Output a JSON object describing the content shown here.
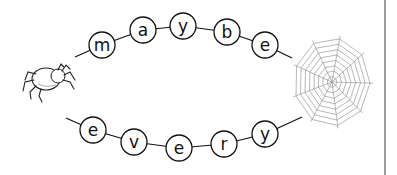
{
  "worksheet": {
    "words": [
      {
        "word": "maybe",
        "letters": [
          "m",
          "a",
          "y",
          "b",
          "e"
        ],
        "beads": [
          {
            "x": 102,
            "y": 45
          },
          {
            "x": 143,
            "y": 30
          },
          {
            "x": 183,
            "y": 26
          },
          {
            "x": 227,
            "y": 32
          },
          {
            "x": 265,
            "y": 45
          }
        ],
        "lead": {
          "x1": 75,
          "y1": 57
        },
        "tail": {
          "x2": 292,
          "y2": 58
        }
      },
      {
        "word": "every",
        "letters": [
          "e",
          "v",
          "e",
          "r",
          "y"
        ],
        "beads": [
          {
            "x": 93,
            "y": 130
          },
          {
            "x": 134,
            "y": 142
          },
          {
            "x": 179,
            "y": 148
          },
          {
            "x": 224,
            "y": 144
          },
          {
            "x": 265,
            "y": 134
          }
        ],
        "lead": {
          "x1": 66,
          "y1": 118
        },
        "tail": {
          "x2": 302,
          "y2": 117
        }
      }
    ],
    "bead_radius": 13,
    "decorations": {
      "spider": "spider-drawing",
      "web": "spider-web-drawing"
    },
    "colors": {
      "ink": "#111111",
      "web": "#888888",
      "divider": "#7a7a7a"
    }
  }
}
